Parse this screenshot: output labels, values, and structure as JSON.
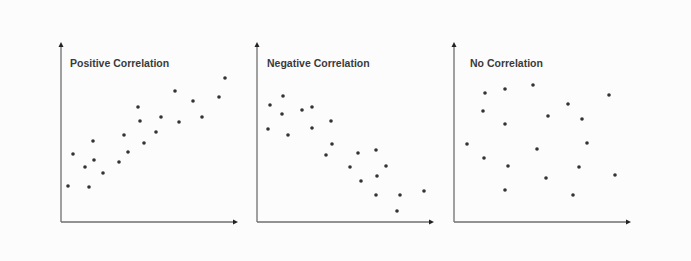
{
  "chart_data": [
    {
      "type": "scatter",
      "title": "Positive Correlation",
      "xlabel": "",
      "ylabel": "",
      "axes": {
        "origin": [
          61,
          222
        ],
        "x_end": 238,
        "y_top": 42
      },
      "grid": false,
      "legend": null,
      "points": [
        [
          68,
          186
        ],
        [
          73,
          154
        ],
        [
          85,
          167
        ],
        [
          89,
          187
        ],
        [
          93,
          141
        ],
        [
          94,
          160
        ],
        [
          103,
          173
        ],
        [
          119,
          162
        ],
        [
          124,
          135
        ],
        [
          128,
          152
        ],
        [
          138,
          107
        ],
        [
          140,
          121
        ],
        [
          144,
          143
        ],
        [
          156,
          132
        ],
        [
          161,
          117
        ],
        [
          175,
          91
        ],
        [
          179,
          122
        ],
        [
          193,
          101
        ],
        [
          202,
          117
        ],
        [
          219,
          97
        ],
        [
          225,
          78
        ]
      ]
    },
    {
      "type": "scatter",
      "title": "Negative Correlation",
      "xlabel": "",
      "ylabel": "",
      "axes": {
        "origin": [
          257,
          222
        ],
        "x_end": 434,
        "y_top": 42
      },
      "grid": false,
      "legend": null,
      "points": [
        [
          270,
          105
        ],
        [
          283,
          96
        ],
        [
          282,
          114
        ],
        [
          268,
          129
        ],
        [
          288,
          135
        ],
        [
          302,
          110
        ],
        [
          312,
          107
        ],
        [
          312,
          128
        ],
        [
          331,
          121
        ],
        [
          332,
          144
        ],
        [
          326,
          155
        ],
        [
          358,
          153
        ],
        [
          376,
          150
        ],
        [
          350,
          167
        ],
        [
          386,
          166
        ],
        [
          361,
          181
        ],
        [
          377,
          176
        ],
        [
          376,
          195
        ],
        [
          400,
          195
        ],
        [
          424,
          191
        ],
        [
          397,
          211
        ]
      ]
    },
    {
      "type": "scatter",
      "title": "No Correlation",
      "xlabel": "",
      "ylabel": "",
      "axes": {
        "origin": [
          454,
          222
        ],
        "x_end": 631,
        "y_top": 42
      },
      "grid": false,
      "legend": null,
      "points": [
        [
          485,
          93
        ],
        [
          505,
          89
        ],
        [
          533,
          85
        ],
        [
          483,
          111
        ],
        [
          505,
          124
        ],
        [
          467,
          144
        ],
        [
          484,
          158
        ],
        [
          508,
          166
        ],
        [
          537,
          149
        ],
        [
          548,
          116
        ],
        [
          568,
          104
        ],
        [
          582,
          119
        ],
        [
          587,
          143
        ],
        [
          579,
          167
        ],
        [
          546,
          178
        ],
        [
          505,
          190
        ],
        [
          573,
          195
        ],
        [
          609,
          95
        ],
        [
          615,
          175
        ]
      ]
    }
  ],
  "panels": [
    {
      "title": "Positive Correlation"
    },
    {
      "title": "Negative Correlation"
    },
    {
      "title": "No Correlation"
    }
  ],
  "colors": {
    "dot": "#333333",
    "axis": "#6f6f6f",
    "title": "#3a3a3a",
    "background": "#fcfcfc"
  }
}
